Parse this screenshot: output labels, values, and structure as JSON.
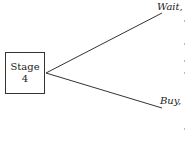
{
  "diagram": {
    "type": "decision-tree",
    "node": {
      "line1": "Stage",
      "line2": "4"
    },
    "branches": [
      {
        "label": "Wait,",
        "from": [
          46,
          73
        ],
        "to": [
          162,
          13
        ]
      },
      {
        "label": "Buy,",
        "from": [
          46,
          73
        ],
        "to": [
          162,
          108
        ]
      }
    ],
    "colors": {
      "line": "#333333",
      "text": "#222222",
      "background": "#ffffff"
    }
  }
}
